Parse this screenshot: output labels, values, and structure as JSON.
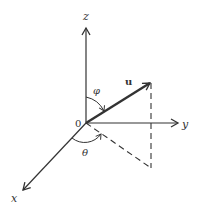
{
  "diagram": {
    "labels": {
      "z_axis": "z",
      "y_axis": "y",
      "x_axis": "x",
      "origin": "0",
      "vector": "u",
      "phi": "φ",
      "theta": "θ"
    },
    "colors": {
      "line": "#333333",
      "background": "#ffffff"
    }
  }
}
